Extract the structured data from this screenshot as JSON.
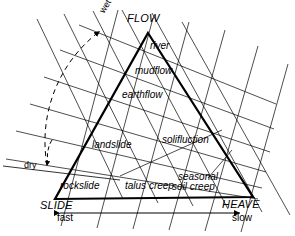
{
  "diagram": {
    "type": "ternary-classification-diagram",
    "vertices": {
      "top": "FLOW",
      "bottom_left": "SLIDE",
      "bottom_right": "HEAVE"
    },
    "inner_labels": [
      "river",
      "mudflow",
      "earthflow",
      "landslide",
      "solifluction",
      "rockslide",
      "talus creep",
      "seasonal",
      "soil creep"
    ],
    "axis_labels": {
      "moisture_high": "wet",
      "moisture_low": "dry",
      "rate_high": "fast",
      "rate_low": "slow"
    },
    "colors": {
      "ink": "#000000",
      "background": "#ffffff"
    }
  }
}
